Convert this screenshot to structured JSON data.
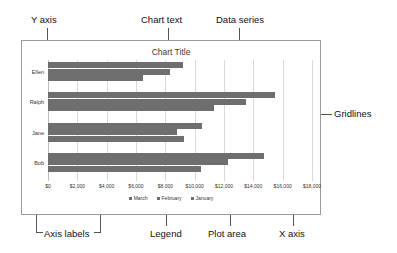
{
  "chart_data": {
    "type": "bar",
    "orientation": "horizontal",
    "title": "Chart Title",
    "xlabel": "",
    "ylabel": "",
    "xlim": [
      0,
      18000
    ],
    "grid": true,
    "legend_position": "bottom",
    "categories": [
      "Ellen",
      "Ralph",
      "Jane",
      "Bob"
    ],
    "xticks": [
      "$0",
      "$2,000",
      "$4,000",
      "$6,000",
      "$8,000",
      "$10,000",
      "$12,000",
      "$14,000",
      "$16,000",
      "$18,000"
    ],
    "xtick_values": [
      0,
      2000,
      4000,
      6000,
      8000,
      10000,
      12000,
      14000,
      16000,
      18000
    ],
    "series": [
      {
        "name": "March",
        "values": [
          9200,
          15500,
          10500,
          14700
        ]
      },
      {
        "name": "February",
        "values": [
          8300,
          13500,
          8800,
          12300
        ]
      },
      {
        "name": "January",
        "values": [
          6500,
          11300,
          9300,
          10400
        ]
      }
    ],
    "bar_color": "#6e6e6e"
  },
  "annotations": {
    "y_axis": "Y axis",
    "chart_text": "Chart text",
    "data_series": "Data series",
    "gridlines": "Gridlines",
    "axis_labels": "Axis labels",
    "legend": "Legend",
    "plot_area": "Plot area",
    "x_axis": "X axis"
  }
}
